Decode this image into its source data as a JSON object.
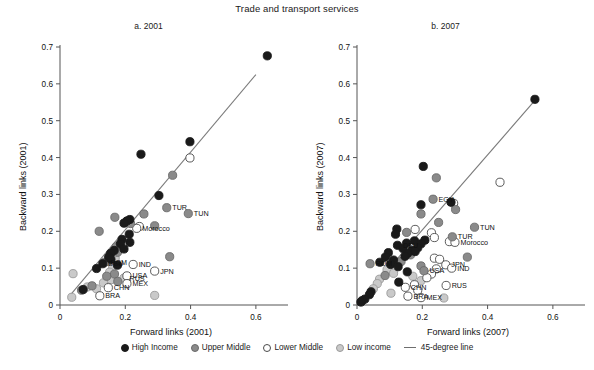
{
  "figure": {
    "title": "Trade and transport services"
  },
  "legend": {
    "position": "bottom-center",
    "items": [
      {
        "label": "High Income",
        "marker": "filled-circle",
        "color": "#1a1a1a",
        "stroke": "#1a1a1a"
      },
      {
        "label": "Upper Middle",
        "marker": "filled-circle",
        "color": "#8a8a8a",
        "stroke": "#6a6a6a"
      },
      {
        "label": "Lower Middle",
        "marker": "open-circle",
        "color": "#ffffff",
        "stroke": "#4a4a4a"
      },
      {
        "label": "Low income",
        "marker": "filled-circle",
        "color": "#c9c9c9",
        "stroke": "#9a9a9a"
      },
      {
        "label": "45-degree line",
        "marker": "line",
        "color": "#6e6e6e",
        "stroke": "#6e6e6e"
      }
    ]
  },
  "chart_data": [
    {
      "type": "scatter",
      "panel": "a",
      "title": "a. 2001",
      "xlabel": "Forward links (2001)",
      "ylabel": "Backward links (2001)",
      "xlim": [
        0,
        0.68
      ],
      "ylim": [
        0,
        0.7
      ],
      "xticks": [
        0,
        0.2,
        0.4,
        0.6
      ],
      "xticklabels": [
        "0",
        "0.2",
        "0.4",
        "0.6"
      ],
      "yticks": [
        0,
        0.1,
        0.2,
        0.3,
        0.4,
        0.5,
        0.6,
        0.7
      ],
      "yticklabels": [
        "0",
        "0.1",
        "0.2",
        "0.3",
        "0.4",
        "0.5",
        "0.6",
        "0.7"
      ],
      "grid": false,
      "reference_line": {
        "label": "45-degree line",
        "from": [
          0.025,
          0.02
        ],
        "to": [
          0.6,
          0.625
        ]
      },
      "points": [
        {
          "x": 0.635,
          "y": 0.676,
          "group": "High Income"
        },
        {
          "x": 0.398,
          "y": 0.443,
          "group": "High Income"
        },
        {
          "x": 0.248,
          "y": 0.409,
          "group": "High Income"
        },
        {
          "x": 0.398,
          "y": 0.399,
          "group": "Lower Middle"
        },
        {
          "x": 0.345,
          "y": 0.352,
          "group": "Upper Middle"
        },
        {
          "x": 0.303,
          "y": 0.297,
          "group": "High Income"
        },
        {
          "x": 0.327,
          "y": 0.264,
          "group": "Upper Middle",
          "label": "TUR"
        },
        {
          "x": 0.393,
          "y": 0.248,
          "group": "Upper Middle",
          "label": "TUN"
        },
        {
          "x": 0.257,
          "y": 0.247,
          "group": "Upper Middle"
        },
        {
          "x": 0.168,
          "y": 0.238,
          "group": "Upper Middle"
        },
        {
          "x": 0.214,
          "y": 0.232,
          "group": "High Income"
        },
        {
          "x": 0.205,
          "y": 0.228,
          "group": "High Income"
        },
        {
          "x": 0.196,
          "y": 0.222,
          "group": "High Income"
        },
        {
          "x": 0.216,
          "y": 0.221,
          "group": "Upper Middle"
        },
        {
          "x": 0.29,
          "y": 0.215,
          "group": "Upper Middle"
        },
        {
          "x": 0.243,
          "y": 0.213,
          "group": "Lower Middle"
        },
        {
          "x": 0.235,
          "y": 0.208,
          "group": "Lower Middle",
          "label": "Morocco"
        },
        {
          "x": 0.12,
          "y": 0.2,
          "group": "Upper Middle"
        },
        {
          "x": 0.212,
          "y": 0.192,
          "group": "High Income"
        },
        {
          "x": 0.19,
          "y": 0.178,
          "group": "High Income"
        },
        {
          "x": 0.214,
          "y": 0.17,
          "group": "High Income"
        },
        {
          "x": 0.185,
          "y": 0.166,
          "group": "High Income"
        },
        {
          "x": 0.172,
          "y": 0.158,
          "group": "Upper Middle"
        },
        {
          "x": 0.196,
          "y": 0.152,
          "group": "High Income"
        },
        {
          "x": 0.166,
          "y": 0.148,
          "group": "High Income"
        },
        {
          "x": 0.176,
          "y": 0.143,
          "group": "Upper Middle"
        },
        {
          "x": 0.155,
          "y": 0.14,
          "group": "High Income"
        },
        {
          "x": 0.16,
          "y": 0.135,
          "group": "Low income"
        },
        {
          "x": 0.336,
          "y": 0.131,
          "group": "Upper Middle"
        },
        {
          "x": 0.149,
          "y": 0.13,
          "group": "High Income"
        },
        {
          "x": 0.169,
          "y": 0.127,
          "group": "Low income"
        },
        {
          "x": 0.156,
          "y": 0.124,
          "group": "High Income"
        },
        {
          "x": 0.147,
          "y": 0.119,
          "group": "Upper Middle"
        },
        {
          "x": 0.137,
          "y": 0.116,
          "group": "Upper Middle",
          "label": "ROM"
        },
        {
          "x": 0.131,
          "y": 0.112,
          "group": "High Income",
          "label": "DEU"
        },
        {
          "x": 0.224,
          "y": 0.11,
          "group": "Lower Middle",
          "label": "IND"
        },
        {
          "x": 0.176,
          "y": 0.108,
          "group": "High Income"
        },
        {
          "x": 0.161,
          "y": 0.105,
          "group": "Low income"
        },
        {
          "x": 0.112,
          "y": 0.099,
          "group": "High Income"
        },
        {
          "x": 0.29,
          "y": 0.092,
          "group": "Lower Middle",
          "label": "JPN"
        },
        {
          "x": 0.152,
          "y": 0.089,
          "group": "Low income"
        },
        {
          "x": 0.04,
          "y": 0.085,
          "group": "Low income"
        },
        {
          "x": 0.167,
          "y": 0.084,
          "group": "Upper Middle"
        },
        {
          "x": 0.205,
          "y": 0.079,
          "group": "Lower Middle",
          "label": "USA"
        },
        {
          "x": 0.143,
          "y": 0.078,
          "group": "Upper Middle"
        },
        {
          "x": 0.196,
          "y": 0.073,
          "group": "Low income",
          "label": "RUS"
        },
        {
          "x": 0.157,
          "y": 0.069,
          "group": "Low income"
        },
        {
          "x": 0.177,
          "y": 0.064,
          "group": "Upper Middle"
        },
        {
          "x": 0.133,
          "y": 0.06,
          "group": "Low income"
        },
        {
          "x": 0.205,
          "y": 0.058,
          "group": "Lower Middle",
          "label": "MEX"
        },
        {
          "x": 0.098,
          "y": 0.052,
          "group": "Upper Middle"
        },
        {
          "x": 0.084,
          "y": 0.049,
          "group": "Low income"
        },
        {
          "x": 0.148,
          "y": 0.047,
          "group": "Lower Middle",
          "label": "CHN"
        },
        {
          "x": 0.112,
          "y": 0.044,
          "group": "Low income"
        },
        {
          "x": 0.071,
          "y": 0.042,
          "group": "High Income"
        },
        {
          "x": 0.066,
          "y": 0.04,
          "group": "Upper Middle"
        },
        {
          "x": 0.29,
          "y": 0.026,
          "group": "Low income"
        },
        {
          "x": 0.122,
          "y": 0.025,
          "group": "Lower Middle",
          "label": "BRA"
        },
        {
          "x": 0.036,
          "y": 0.021,
          "group": "Low income"
        }
      ]
    },
    {
      "type": "scatter",
      "panel": "b",
      "title": "b. 2007",
      "xlabel": "Forward links (2007)",
      "ylabel": "Backward links (2007)",
      "xlim": [
        0,
        0.68
      ],
      "ylim": [
        0,
        0.7
      ],
      "xticks": [
        0,
        0.2,
        0.4,
        0.6
      ],
      "xticklabels": [
        "0",
        "0.2",
        "0.4",
        "0.6"
      ],
      "yticks": [
        0,
        0.1,
        0.2,
        0.3,
        0.4,
        0.5,
        0.6,
        0.7
      ],
      "yticklabels": [
        "0",
        "0.1",
        "0.2",
        "0.3",
        "0.4",
        "0.5",
        "0.6",
        "0.7"
      ],
      "grid": false,
      "reference_line": {
        "label": "45-degree line",
        "from": [
          0.008,
          0.008
        ],
        "to": [
          0.545,
          0.555
        ]
      },
      "points": [
        {
          "x": 0.545,
          "y": 0.558,
          "group": "High Income"
        },
        {
          "x": 0.438,
          "y": 0.333,
          "group": "Lower Middle"
        },
        {
          "x": 0.203,
          "y": 0.376,
          "group": "High Income"
        },
        {
          "x": 0.243,
          "y": 0.345,
          "group": "Upper Middle"
        },
        {
          "x": 0.233,
          "y": 0.287,
          "group": "Upper Middle",
          "label": "EGY"
        },
        {
          "x": 0.196,
          "y": 0.272,
          "group": "High Income"
        },
        {
          "x": 0.288,
          "y": 0.279,
          "group": "High Income"
        },
        {
          "x": 0.296,
          "y": 0.276,
          "group": "Lower Middle"
        },
        {
          "x": 0.302,
          "y": 0.259,
          "group": "Upper Middle"
        },
        {
          "x": 0.196,
          "y": 0.247,
          "group": "Upper Middle"
        },
        {
          "x": 0.25,
          "y": 0.224,
          "group": "Upper Middle"
        },
        {
          "x": 0.36,
          "y": 0.211,
          "group": "Upper Middle",
          "label": "TUN"
        },
        {
          "x": 0.122,
          "y": 0.206,
          "group": "High Income"
        },
        {
          "x": 0.178,
          "y": 0.205,
          "group": "Lower Middle"
        },
        {
          "x": 0.152,
          "y": 0.197,
          "group": "Upper Middle"
        },
        {
          "x": 0.228,
          "y": 0.196,
          "group": "Lower Middle"
        },
        {
          "x": 0.118,
          "y": 0.192,
          "group": "High Income"
        },
        {
          "x": 0.292,
          "y": 0.185,
          "group": "Upper Middle",
          "label": "TUR"
        },
        {
          "x": 0.237,
          "y": 0.183,
          "group": "Lower Middle"
        },
        {
          "x": 0.208,
          "y": 0.176,
          "group": "High Income"
        },
        {
          "x": 0.176,
          "y": 0.174,
          "group": "High Income"
        },
        {
          "x": 0.283,
          "y": 0.172,
          "group": "Lower Middle"
        },
        {
          "x": 0.3,
          "y": 0.17,
          "group": "Lower Middle",
          "label": "Morocco"
        },
        {
          "x": 0.152,
          "y": 0.168,
          "group": "High Income"
        },
        {
          "x": 0.196,
          "y": 0.166,
          "group": "High Income"
        },
        {
          "x": 0.124,
          "y": 0.162,
          "group": "High Income",
          "label": "DEU"
        },
        {
          "x": 0.186,
          "y": 0.155,
          "group": "High Income"
        },
        {
          "x": 0.141,
          "y": 0.153,
          "group": "High Income"
        },
        {
          "x": 0.168,
          "y": 0.148,
          "group": "High Income"
        },
        {
          "x": 0.178,
          "y": 0.145,
          "group": "High Income"
        },
        {
          "x": 0.096,
          "y": 0.142,
          "group": "High Income"
        },
        {
          "x": 0.155,
          "y": 0.14,
          "group": "High Income"
        },
        {
          "x": 0.164,
          "y": 0.136,
          "group": "Upper Middle"
        },
        {
          "x": 0.147,
          "y": 0.132,
          "group": "High Income"
        },
        {
          "x": 0.087,
          "y": 0.13,
          "group": "High Income"
        },
        {
          "x": 0.338,
          "y": 0.13,
          "group": "Upper Middle"
        },
        {
          "x": 0.237,
          "y": 0.127,
          "group": "Lower Middle"
        },
        {
          "x": 0.253,
          "y": 0.124,
          "group": "Lower Middle"
        },
        {
          "x": 0.112,
          "y": 0.122,
          "group": "High Income"
        },
        {
          "x": 0.135,
          "y": 0.118,
          "group": "Upper Middle"
        },
        {
          "x": 0.07,
          "y": 0.116,
          "group": "High Income"
        },
        {
          "x": 0.04,
          "y": 0.112,
          "group": "Upper Middle",
          "label": "ROM"
        },
        {
          "x": 0.103,
          "y": 0.11,
          "group": "High Income"
        },
        {
          "x": 0.272,
          "y": 0.109,
          "group": "Lower Middle",
          "label": "JPN"
        },
        {
          "x": 0.196,
          "y": 0.106,
          "group": "Upper Middle"
        },
        {
          "x": 0.126,
          "y": 0.104,
          "group": "High Income"
        },
        {
          "x": 0.29,
          "y": 0.1,
          "group": "Lower Middle",
          "label": "IND"
        },
        {
          "x": 0.243,
          "y": 0.098,
          "group": "Lower Middle"
        },
        {
          "x": 0.092,
          "y": 0.096,
          "group": "Low income"
        },
        {
          "x": 0.205,
          "y": 0.093,
          "group": "Upper Middle",
          "label": "USA"
        },
        {
          "x": 0.154,
          "y": 0.09,
          "group": "High Income"
        },
        {
          "x": 0.112,
          "y": 0.086,
          "group": "Low income"
        },
        {
          "x": 0.228,
          "y": 0.084,
          "group": "Lower Middle"
        },
        {
          "x": 0.086,
          "y": 0.08,
          "group": "Upper Middle"
        },
        {
          "x": 0.171,
          "y": 0.078,
          "group": "Low income"
        },
        {
          "x": 0.214,
          "y": 0.074,
          "group": "Lower Middle"
        },
        {
          "x": 0.069,
          "y": 0.07,
          "group": "Low income"
        },
        {
          "x": 0.196,
          "y": 0.066,
          "group": "Low income"
        },
        {
          "x": 0.128,
          "y": 0.062,
          "group": "High Income"
        },
        {
          "x": 0.062,
          "y": 0.058,
          "group": "Low income"
        },
        {
          "x": 0.176,
          "y": 0.055,
          "group": "Lower Middle"
        },
        {
          "x": 0.273,
          "y": 0.053,
          "group": "Lower Middle",
          "label": "RUS"
        },
        {
          "x": 0.148,
          "y": 0.048,
          "group": "Lower Middle",
          "label": "CHN"
        },
        {
          "x": 0.05,
          "y": 0.044,
          "group": "Low income"
        },
        {
          "x": 0.186,
          "y": 0.04,
          "group": "Lower Middle"
        },
        {
          "x": 0.043,
          "y": 0.036,
          "group": "High Income"
        },
        {
          "x": 0.104,
          "y": 0.032,
          "group": "Low income"
        },
        {
          "x": 0.038,
          "y": 0.028,
          "group": "High Income"
        },
        {
          "x": 0.156,
          "y": 0.024,
          "group": "Lower Middle",
          "label": "BRA"
        },
        {
          "x": 0.196,
          "y": 0.02,
          "group": "Lower Middle",
          "label": "MEX"
        },
        {
          "x": 0.266,
          "y": 0.019,
          "group": "Low income"
        },
        {
          "x": 0.024,
          "y": 0.016,
          "group": "High Income"
        },
        {
          "x": 0.016,
          "y": 0.012,
          "group": "High Income"
        },
        {
          "x": 0.012,
          "y": 0.008,
          "group": "High Income"
        }
      ]
    }
  ]
}
